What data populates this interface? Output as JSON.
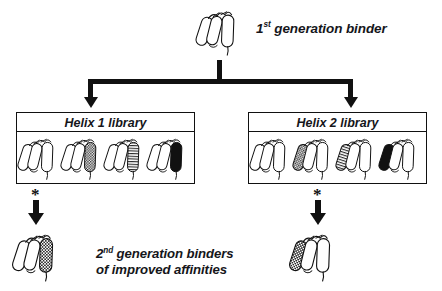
{
  "diagram": {
    "title_top": "1st generation binder",
    "title_top_main": "1",
    "title_top_sup": "st",
    "title_top_rest": " generation binder",
    "bottom_caption_line1_main": "2",
    "bottom_caption_line1_sup": "nd",
    "bottom_caption_line1_rest": " generation binders",
    "bottom_caption_line2": "of improved affinities",
    "asterisk": "*",
    "colors": {
      "ink": "#111111",
      "background": "#ffffff",
      "solid_fill": "#111111",
      "hatch_fill": "#6f6f6f",
      "open_fill": "#ffffff"
    }
  },
  "libraries": [
    {
      "id": "helix-1-library",
      "title": "Helix 1 library",
      "varied_helix_position": "right",
      "members": [
        {
          "index": 1,
          "pattern": "open"
        },
        {
          "index": 2,
          "pattern": "checker"
        },
        {
          "index": 3,
          "pattern": "stripe"
        },
        {
          "index": 4,
          "pattern": "solid"
        }
      ]
    },
    {
      "id": "helix-2-library",
      "title": "Helix 2 library",
      "varied_helix_position": "left",
      "members": [
        {
          "index": 1,
          "pattern": "open"
        },
        {
          "index": 2,
          "pattern": "checker"
        },
        {
          "index": 3,
          "pattern": "stripe"
        },
        {
          "index": 4,
          "pattern": "solid"
        }
      ]
    }
  ],
  "outputs": [
    {
      "id": "second-gen-binder-left",
      "pattern": "checker",
      "varied_helix_position": "right"
    },
    {
      "id": "second-gen-binder-right",
      "pattern": "checker",
      "varied_helix_position": "left"
    }
  ],
  "parent": {
    "id": "first-gen-binder",
    "pattern": "open",
    "varied_helix_position": "none"
  }
}
